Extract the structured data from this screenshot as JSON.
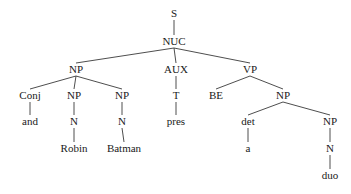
{
  "diagram": {
    "type": "syntax-tree",
    "nodes": [
      {
        "id": "s",
        "label": "S",
        "x": 174,
        "y": 17
      },
      {
        "id": "nuc",
        "label": "NUC",
        "x": 174,
        "y": 45
      },
      {
        "id": "np1",
        "label": "NP",
        "x": 76,
        "y": 73
      },
      {
        "id": "aux",
        "label": "AUX",
        "x": 176,
        "y": 73
      },
      {
        "id": "vp",
        "label": "VP",
        "x": 250,
        "y": 73
      },
      {
        "id": "conj",
        "label": "Conj",
        "x": 30,
        "y": 99
      },
      {
        "id": "np2",
        "label": "NP",
        "x": 74,
        "y": 99
      },
      {
        "id": "np3",
        "label": "NP",
        "x": 122,
        "y": 99
      },
      {
        "id": "t",
        "label": "T",
        "x": 176,
        "y": 99
      },
      {
        "id": "be",
        "label": "BE",
        "x": 216,
        "y": 99
      },
      {
        "id": "np4",
        "label": "NP",
        "x": 283,
        "y": 99
      },
      {
        "id": "and",
        "label": "and",
        "x": 30,
        "y": 125
      },
      {
        "id": "n1",
        "label": "N",
        "x": 74,
        "y": 125
      },
      {
        "id": "n2",
        "label": "N",
        "x": 122,
        "y": 125
      },
      {
        "id": "pres",
        "label": "pres",
        "x": 176,
        "y": 125
      },
      {
        "id": "det",
        "label": "det",
        "x": 248,
        "y": 125
      },
      {
        "id": "np5",
        "label": "NP",
        "x": 330,
        "y": 125
      },
      {
        "id": "robin",
        "label": "Robin",
        "x": 74,
        "y": 152
      },
      {
        "id": "batman",
        "label": "Batman",
        "x": 124,
        "y": 152
      },
      {
        "id": "a",
        "label": "a",
        "x": 248,
        "y": 152
      },
      {
        "id": "n3",
        "label": "N",
        "x": 330,
        "y": 152
      },
      {
        "id": "duo",
        "label": "duo",
        "x": 330,
        "y": 179
      }
    ],
    "edges": [
      [
        "s",
        "nuc"
      ],
      [
        "nuc",
        "np1"
      ],
      [
        "nuc",
        "aux"
      ],
      [
        "nuc",
        "vp"
      ],
      [
        "np1",
        "conj"
      ],
      [
        "np1",
        "np2"
      ],
      [
        "np1",
        "np3"
      ],
      [
        "aux",
        "t"
      ],
      [
        "vp",
        "be"
      ],
      [
        "vp",
        "np4"
      ],
      [
        "conj",
        "and"
      ],
      [
        "np2",
        "n1"
      ],
      [
        "np3",
        "n2"
      ],
      [
        "t",
        "pres"
      ],
      [
        "np4",
        "det"
      ],
      [
        "np4",
        "np5"
      ],
      [
        "n1",
        "robin"
      ],
      [
        "n2",
        "batman"
      ],
      [
        "det",
        "a"
      ],
      [
        "np5",
        "n3"
      ],
      [
        "n3",
        "duo"
      ]
    ]
  }
}
